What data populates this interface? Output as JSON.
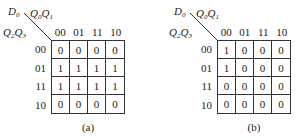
{
  "maps": [
    {
      "id": "a",
      "output_label": {
        "base": "D",
        "sub": "0"
      },
      "col_vars": [
        {
          "base": "Q",
          "sub": "0"
        },
        {
          "base": "Q",
          "sub": "1"
        }
      ],
      "row_vars": [
        {
          "base": "Q",
          "sub": "2"
        },
        {
          "base": "Q",
          "sub": "3"
        }
      ],
      "col_headers": [
        "00",
        "01",
        "11",
        "10"
      ],
      "row_headers": [
        "00",
        "01",
        "11",
        "10"
      ],
      "cells": [
        [
          "0",
          "0",
          "0",
          "0"
        ],
        [
          "1",
          "1",
          "1",
          "1"
        ],
        [
          "1",
          "1",
          "1",
          "1"
        ],
        [
          "0",
          "0",
          "0",
          "0"
        ]
      ],
      "caption": "(a)"
    },
    {
      "id": "b",
      "output_label": {
        "base": "D",
        "sub": "0"
      },
      "col_vars": [
        {
          "base": "Q",
          "sub": "0"
        },
        {
          "base": "Q",
          "sub": "1"
        }
      ],
      "row_vars": [
        {
          "base": "Q",
          "sub": "2"
        },
        {
          "base": "Q",
          "sub": "3"
        }
      ],
      "col_headers": [
        "00",
        "01",
        "11",
        "10"
      ],
      "row_headers": [
        "00",
        "01",
        "11",
        "10"
      ],
      "cells": [
        [
          "1",
          "0",
          "0",
          "0"
        ],
        [
          "1",
          "0",
          "0",
          "0"
        ],
        [
          "0",
          "0",
          "0",
          "0"
        ],
        [
          "0",
          "0",
          "0",
          "0"
        ]
      ],
      "caption": "(b)"
    }
  ],
  "colors": {
    "line": "#333333",
    "text": "#222222",
    "background": "#ffffff"
  }
}
